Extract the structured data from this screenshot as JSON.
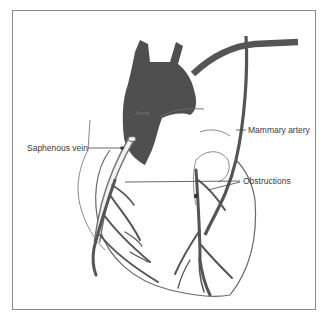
{
  "diagram": {
    "labels": {
      "aorta": "Aorta",
      "saphenous_vein": "Saphenous vein",
      "mammary_artery": "Mammary artery",
      "obstructions": "Obstructions"
    },
    "colors": {
      "vessel": "#555555",
      "outline": "#6a6a6a",
      "frame": "#8a8a8a",
      "text": "#3a3a3a"
    }
  }
}
